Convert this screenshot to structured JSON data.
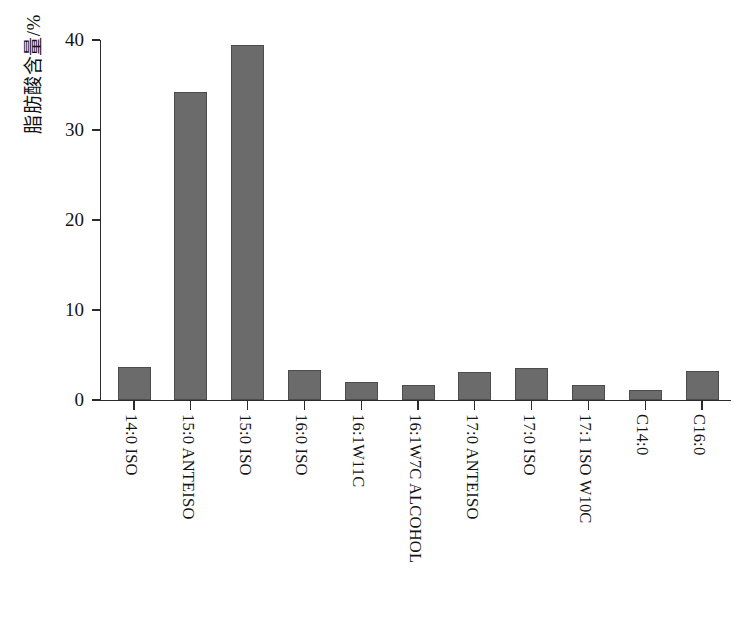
{
  "chart_data": {
    "type": "bar",
    "title": "",
    "xlabel": "",
    "ylabel": "脂肪酸含量/%",
    "ylim": [
      0,
      40
    ],
    "ytick_labels": [
      "0",
      "10",
      "20",
      "30",
      "40"
    ],
    "ytick_values": [
      0,
      10,
      20,
      30,
      40
    ],
    "grid": false,
    "legend": "none",
    "bar_color": "#6b6b6b",
    "bar_edge_color": "#4c4c4c",
    "background_color": "#ffffff",
    "axis_color": "#2b2b2b",
    "categories": [
      "14:0 ISO",
      "15:0 ANTEISO",
      "15:0 ISO",
      "16:0 ISO",
      "16:1W11C",
      "16:1W7C ALCOHOL",
      "17:0 ANTEISO",
      "17:0 ISO",
      "17:1 ISO W10C",
      "C14:0",
      "C16:0"
    ],
    "values": [
      3.7,
      34.2,
      39.5,
      3.3,
      2.0,
      1.7,
      3.1,
      3.6,
      1.7,
      1.1,
      3.2
    ]
  }
}
